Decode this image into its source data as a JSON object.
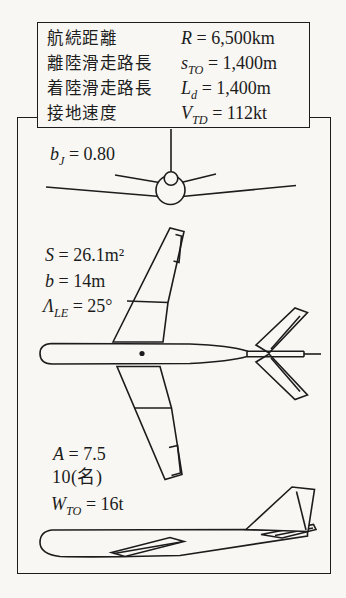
{
  "page": {
    "bg_color": "#f8f7f3",
    "ink_color": "#1c1c1c",
    "figure_kind": "aircraft-three-view-spec-figure"
  },
  "spec_box": {
    "rows": [
      {
        "label": "航続距離",
        "var": "R",
        "sub": "",
        "rest": " = 6,500km"
      },
      {
        "label": "離陸滑走路長",
        "var": "s",
        "sub": "TO",
        "rest": " = 1,400m"
      },
      {
        "label": "着陸滑走路長",
        "var": "L",
        "sub": "d",
        "rest": " = 1,400m"
      },
      {
        "label": "接地速度",
        "var": "V",
        "sub": "TD",
        "rest": " = 112kt"
      }
    ]
  },
  "annotations": {
    "bypass_ratio": {
      "var": "b",
      "sub": "J",
      "rest": " = 0.80"
    },
    "wing_area": {
      "var": "S",
      "sub": "",
      "rest": " = 26.1m²"
    },
    "wing_span": {
      "var": "b",
      "sub": "",
      "rest": " = 14m"
    },
    "sweep_angle": {
      "var": "Λ",
      "sub": "LE",
      "rest": " = 25°"
    },
    "aspect_ratio": {
      "var": "A",
      "sub": "",
      "rest": " = 7.5"
    },
    "capacity": {
      "var": "",
      "sub": "",
      "rest": "10(名)"
    },
    "takeoff_weight": {
      "var": "W",
      "sub": "TO",
      "rest": " = 16t"
    }
  },
  "views": {
    "front": "front-view",
    "plan": "plan-view",
    "side": "side-view"
  }
}
